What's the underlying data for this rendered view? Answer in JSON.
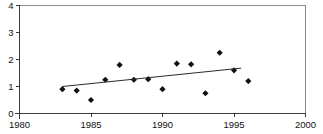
{
  "chart_data": {
    "type": "scatter",
    "title": "",
    "subtitle": "",
    "xlabel": "",
    "ylabel": "",
    "xlim": [
      1980,
      2000
    ],
    "ylim": [
      0,
      4
    ],
    "grid": false,
    "legend": null,
    "x_ticks": [
      1980,
      1985,
      1990,
      1995,
      2000
    ],
    "x_tick_labels": [
      "1980",
      "1985",
      "1990",
      "1995",
      "2000"
    ],
    "y_ticks": [
      0,
      1,
      2,
      3,
      4
    ],
    "y_tick_labels": [
      "0",
      "1",
      "2",
      "3",
      "4"
    ],
    "marker": "diamond",
    "marker_color": "#111111",
    "series": [
      {
        "name": "observations",
        "type": "scatter",
        "x": [
          1983,
          1984,
          1985,
          1986,
          1987,
          1988,
          1989,
          1990,
          1991,
          1992,
          1993,
          1994,
          1995,
          1996
        ],
        "values": [
          0.9,
          0.85,
          0.5,
          1.25,
          1.8,
          1.25,
          1.27,
          0.9,
          1.85,
          1.82,
          0.75,
          2.25,
          1.6,
          1.2
        ]
      },
      {
        "name": "trend-line",
        "type": "line",
        "x": [
          1983,
          1995.5
        ],
        "values": [
          1.0,
          1.68
        ],
        "color": "#2b2b2b"
      }
    ]
  },
  "axes": {
    "y_axis_name": "value-axis",
    "x_axis_name": "year-axis"
  }
}
